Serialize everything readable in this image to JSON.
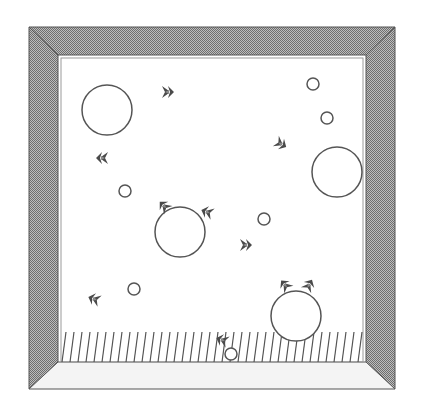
{
  "game": {
    "type": "arena",
    "colors": {
      "background": "#ffffff",
      "wall_dark": "#8a8a8a",
      "wall_light": "#f4f4f4",
      "outline": "#555555",
      "creature": "#4a4a4a",
      "hatch": "#555555"
    },
    "frame": {
      "outer": {
        "x1": 29,
        "y1": 27,
        "x2": 395,
        "y2": 389
      },
      "inner": {
        "x1": 58,
        "y1": 55,
        "x2": 366,
        "y2": 362
      }
    },
    "floor_hatch": {
      "y1": 332,
      "y2": 362,
      "spacing": 8
    },
    "big_circles": [
      {
        "cx": 107,
        "cy": 110,
        "r": 25
      },
      {
        "cx": 337,
        "cy": 172,
        "r": 25
      },
      {
        "cx": 180,
        "cy": 232,
        "r": 25
      },
      {
        "cx": 296,
        "cy": 316,
        "r": 25
      }
    ],
    "small_circles": [
      {
        "cx": 313,
        "cy": 84,
        "r": 6
      },
      {
        "cx": 327,
        "cy": 118,
        "r": 6
      },
      {
        "cx": 125,
        "cy": 191,
        "r": 6
      },
      {
        "cx": 264,
        "cy": 219,
        "r": 6
      },
      {
        "cx": 134,
        "cy": 289,
        "r": 6
      },
      {
        "cx": 231,
        "cy": 354,
        "r": 6
      }
    ],
    "creatures": [
      {
        "x": 168,
        "y": 92,
        "rot": 0
      },
      {
        "x": 102,
        "y": 158,
        "rot": 180
      },
      {
        "x": 281,
        "y": 144,
        "rot": 30
      },
      {
        "x": 164,
        "y": 206,
        "rot": 225
      },
      {
        "x": 207,
        "y": 212,
        "rot": 200
      },
      {
        "x": 246,
        "y": 245,
        "rot": 0
      },
      {
        "x": 94,
        "y": 299,
        "rot": 200
      },
      {
        "x": 285,
        "y": 285,
        "rot": 230
      },
      {
        "x": 309,
        "y": 285,
        "rot": 300
      },
      {
        "x": 222,
        "y": 340,
        "rot": 200
      }
    ]
  }
}
